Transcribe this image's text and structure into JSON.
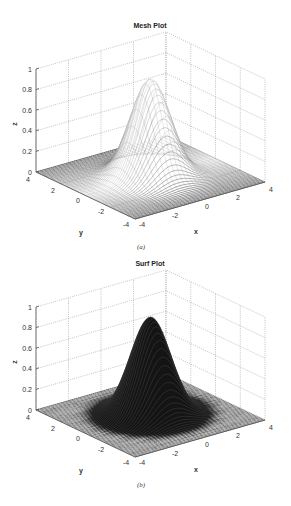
{
  "chart_data": [
    {
      "type": "surface-mesh",
      "title": "Mesh Plot",
      "caption": "(a)",
      "xlabel": "x",
      "ylabel": "y",
      "zlabel": "z",
      "x_ticks": [
        "-4",
        "-2",
        "0",
        "2",
        "4"
      ],
      "y_ticks": [
        "4",
        "2",
        "0",
        "-2",
        "-4"
      ],
      "z_ticks": [
        "0",
        "0.2",
        "0.4",
        "0.6",
        "0.8",
        "1"
      ],
      "xlim": [
        -4,
        4
      ],
      "ylim": [
        -4,
        4
      ],
      "zlim": [
        0,
        1
      ],
      "grid": true,
      "function": "z = exp(-(x^2 + y^2)/2)",
      "peak": {
        "x": 0,
        "y": 0,
        "z": 0.95
      },
      "style": "mesh",
      "origin_y": 0
    },
    {
      "type": "surface",
      "title": "Surf Plot",
      "caption": "(b)",
      "xlabel": "x",
      "ylabel": "y",
      "zlabel": "z",
      "x_ticks": [
        "-4",
        "-2",
        "0",
        "2",
        "4"
      ],
      "y_ticks": [
        "4",
        "2",
        "0",
        "-2",
        "-4"
      ],
      "z_ticks": [
        "0",
        "0.2",
        "0.4",
        "0.6",
        "0.8",
        "1"
      ],
      "xlim": [
        -4,
        4
      ],
      "ylim": [
        -4,
        4
      ],
      "zlim": [
        0,
        1
      ],
      "grid": true,
      "function": "z = exp(-(x^2 + y^2)/2)",
      "peak": {
        "x": 0,
        "y": 0,
        "z": 0.95
      },
      "style": "surf",
      "origin_y": 238
    }
  ],
  "colors": {
    "mesh_dark": "#1a1a1a",
    "mesh_light": "#f4f4f4",
    "surf": "#111111",
    "grid": "#9a9a9a",
    "axis": "#555555"
  }
}
